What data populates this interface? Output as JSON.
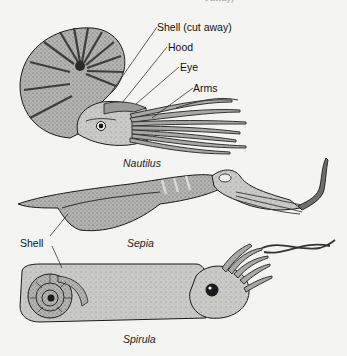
{
  "figure": {
    "specimens": [
      {
        "name": "Nautilus",
        "labels": [
          "Shell (cut away)",
          "Hood",
          "Eye",
          "Arms"
        ]
      },
      {
        "name": "Sepia",
        "labels": []
      },
      {
        "name": "Spirula",
        "labels": []
      }
    ],
    "shared_labels": {
      "shell": "Shell"
    },
    "top_fragment": "t away)"
  },
  "colors": {
    "background": "#f4f4f2",
    "ink": "#1a1a1a",
    "body_fill": "#b9b9b6",
    "dark_fill": "#6e6e6b",
    "light_fill": "#d2d2cf"
  }
}
